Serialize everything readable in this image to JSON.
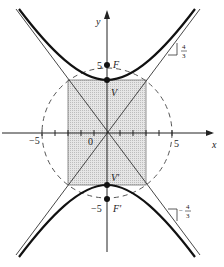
{
  "figure": {
    "type": "hyperbola-diagram",
    "equation_hint": "y^2/16 - x^2/9 = 1",
    "axes": {
      "x_label": "x",
      "y_label": "y"
    },
    "labels": {
      "origin": "0",
      "x_neg5": "−5",
      "x_pos5": "5",
      "y_pos5": "5",
      "y_neg5": "−5",
      "focus_top": "F",
      "focus_bottom": "F′",
      "vertex_top": "V",
      "vertex_bottom": "V′",
      "slope_pos_num": "4",
      "slope_pos_den": "3",
      "slope_neg_sign": "−",
      "slope_neg_num": "4",
      "slope_neg_den": "3"
    },
    "params": {
      "a": 4,
      "b": 3,
      "c": 5
    },
    "colors": {
      "curve": "#111111",
      "asymptote": "#333333",
      "box_fill": "#d9d9d9",
      "circle": "#555555"
    }
  }
}
